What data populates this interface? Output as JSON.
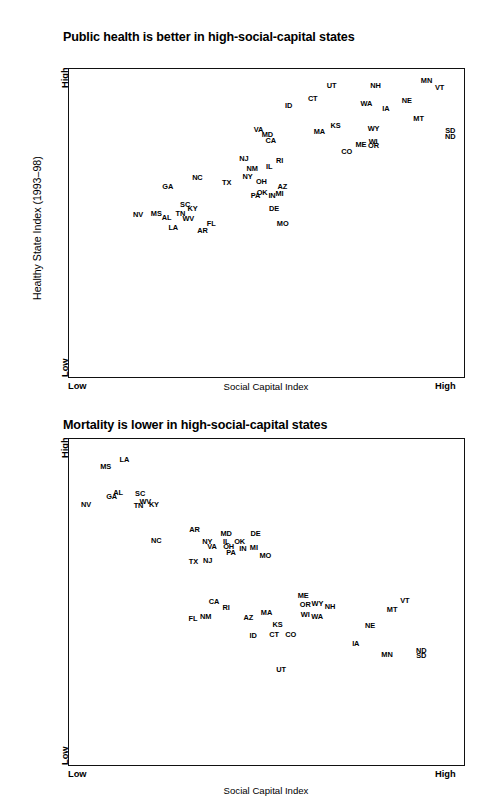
{
  "figure": {
    "axis_y_title": "Healthy State Index (1993–98)",
    "axis_x_title": "Social Capital Index",
    "low_label": "Low",
    "high_label": "High"
  },
  "chart_data": [
    {
      "type": "scatter",
      "title": "Public health is better in high-social-capital states",
      "xlabel": "Social Capital Index",
      "ylabel": "Healthy State Index (1993–98)",
      "xlim": [
        "Low",
        "High"
      ],
      "ylim": [
        "Low",
        "High"
      ],
      "grid": false,
      "legend": "none",
      "point_label_mode": "state-abbreviation",
      "points": [
        {
          "label": "UT",
          "x": 0.665,
          "y": 0.947
        },
        {
          "label": "NH",
          "x": 0.776,
          "y": 0.949
        },
        {
          "label": "MN",
          "x": 0.905,
          "y": 0.963
        },
        {
          "label": "VT",
          "x": 0.938,
          "y": 0.94
        },
        {
          "label": "CT",
          "x": 0.617,
          "y": 0.905
        },
        {
          "label": "NE",
          "x": 0.855,
          "y": 0.9
        },
        {
          "label": "WA",
          "x": 0.753,
          "y": 0.89
        },
        {
          "label": "ID",
          "x": 0.556,
          "y": 0.884
        },
        {
          "label": "IA",
          "x": 0.802,
          "y": 0.874
        },
        {
          "label": "MT",
          "x": 0.885,
          "y": 0.84
        },
        {
          "label": "KS",
          "x": 0.675,
          "y": 0.819
        },
        {
          "label": "WY",
          "x": 0.771,
          "y": 0.808
        },
        {
          "label": "VA",
          "x": 0.48,
          "y": 0.806
        },
        {
          "label": "MA",
          "x": 0.634,
          "y": 0.798
        },
        {
          "label": "SD",
          "x": 0.965,
          "y": 0.801
        },
        {
          "label": "MD",
          "x": 0.502,
          "y": 0.789
        },
        {
          "label": "ND",
          "x": 0.965,
          "y": 0.784
        },
        {
          "label": "CA",
          "x": 0.511,
          "y": 0.77
        },
        {
          "label": "WI",
          "x": 0.77,
          "y": 0.765
        },
        {
          "label": "ME",
          "x": 0.739,
          "y": 0.756
        },
        {
          "label": "OR",
          "x": 0.771,
          "y": 0.753
        },
        {
          "label": "CO",
          "x": 0.703,
          "y": 0.734
        },
        {
          "label": "NJ",
          "x": 0.443,
          "y": 0.71
        },
        {
          "label": "RI",
          "x": 0.533,
          "y": 0.704
        },
        {
          "label": "IL",
          "x": 0.507,
          "y": 0.685
        },
        {
          "label": "NM",
          "x": 0.464,
          "y": 0.68
        },
        {
          "label": "NY",
          "x": 0.452,
          "y": 0.651
        },
        {
          "label": "NC",
          "x": 0.325,
          "y": 0.65
        },
        {
          "label": "OH",
          "x": 0.487,
          "y": 0.635
        },
        {
          "label": "TX",
          "x": 0.399,
          "y": 0.633
        },
        {
          "label": "GA",
          "x": 0.25,
          "y": 0.62
        },
        {
          "label": "AZ",
          "x": 0.54,
          "y": 0.619
        },
        {
          "label": "OK",
          "x": 0.489,
          "y": 0.6
        },
        {
          "label": "MI",
          "x": 0.533,
          "y": 0.599
        },
        {
          "label": "PA",
          "x": 0.472,
          "y": 0.591
        },
        {
          "label": "IN",
          "x": 0.514,
          "y": 0.59
        },
        {
          "label": "SC",
          "x": 0.294,
          "y": 0.562
        },
        {
          "label": "KY",
          "x": 0.313,
          "y": 0.549
        },
        {
          "label": "DE",
          "x": 0.519,
          "y": 0.549
        },
        {
          "label": "NV",
          "x": 0.175,
          "y": 0.53
        },
        {
          "label": "MS",
          "x": 0.221,
          "y": 0.532
        },
        {
          "label": "TN",
          "x": 0.282,
          "y": 0.534
        },
        {
          "label": "AL",
          "x": 0.247,
          "y": 0.518
        },
        {
          "label": "WV",
          "x": 0.302,
          "y": 0.517
        },
        {
          "label": "FL",
          "x": 0.36,
          "y": 0.5
        },
        {
          "label": "MO",
          "x": 0.541,
          "y": 0.5
        },
        {
          "label": "LA",
          "x": 0.264,
          "y": 0.487
        },
        {
          "label": "AR",
          "x": 0.338,
          "y": 0.477
        }
      ]
    },
    {
      "type": "scatter",
      "title": "Mortality is lower in high-social-capital states",
      "xlabel": "Social Capital Index",
      "ylabel": "Healthy State Index (1993–98)",
      "xlim": [
        "Low",
        "High"
      ],
      "ylim": [
        "Low",
        "High"
      ],
      "grid": false,
      "legend": "none",
      "point_label_mode": "state-abbreviation",
      "points": [
        {
          "label": "LA",
          "x": 0.14,
          "y": 0.94
        },
        {
          "label": "MS",
          "x": 0.093,
          "y": 0.916
        },
        {
          "label": "AL",
          "x": 0.124,
          "y": 0.838
        },
        {
          "label": "SC",
          "x": 0.18,
          "y": 0.834
        },
        {
          "label": "GA",
          "x": 0.108,
          "y": 0.825
        },
        {
          "label": "WV",
          "x": 0.193,
          "y": 0.81
        },
        {
          "label": "NV",
          "x": 0.043,
          "y": 0.802
        },
        {
          "label": "KY",
          "x": 0.215,
          "y": 0.8
        },
        {
          "label": "TN",
          "x": 0.176,
          "y": 0.797
        },
        {
          "label": "AR",
          "x": 0.318,
          "y": 0.724
        },
        {
          "label": "MD",
          "x": 0.398,
          "y": 0.711
        },
        {
          "label": "DE",
          "x": 0.472,
          "y": 0.711
        },
        {
          "label": "NC",
          "x": 0.221,
          "y": 0.69
        },
        {
          "label": "NY",
          "x": 0.35,
          "y": 0.688
        },
        {
          "label": "IL",
          "x": 0.398,
          "y": 0.688
        },
        {
          "label": "OK",
          "x": 0.432,
          "y": 0.688
        },
        {
          "label": "VA",
          "x": 0.362,
          "y": 0.673
        },
        {
          "label": "OH",
          "x": 0.404,
          "y": 0.672
        },
        {
          "label": "IN",
          "x": 0.44,
          "y": 0.666
        },
        {
          "label": "MI",
          "x": 0.468,
          "y": 0.669
        },
        {
          "label": "PA",
          "x": 0.41,
          "y": 0.654
        },
        {
          "label": "MO",
          "x": 0.497,
          "y": 0.644
        },
        {
          "label": "TX",
          "x": 0.315,
          "y": 0.626
        },
        {
          "label": "NJ",
          "x": 0.351,
          "y": 0.628
        },
        {
          "label": "ME",
          "x": 0.593,
          "y": 0.523
        },
        {
          "label": "VT",
          "x": 0.85,
          "y": 0.506
        },
        {
          "label": "CA",
          "x": 0.367,
          "y": 0.503
        },
        {
          "label": "OR",
          "x": 0.598,
          "y": 0.493
        },
        {
          "label": "WY",
          "x": 0.629,
          "y": 0.496
        },
        {
          "label": "NH",
          "x": 0.661,
          "y": 0.488
        },
        {
          "label": "RI",
          "x": 0.398,
          "y": 0.485
        },
        {
          "label": "MT",
          "x": 0.818,
          "y": 0.478
        },
        {
          "label": "MA",
          "x": 0.5,
          "y": 0.47
        },
        {
          "label": "WI",
          "x": 0.598,
          "y": 0.464
        },
        {
          "label": "NM",
          "x": 0.346,
          "y": 0.458
        },
        {
          "label": "WA",
          "x": 0.628,
          "y": 0.456
        },
        {
          "label": "AZ",
          "x": 0.454,
          "y": 0.455
        },
        {
          "label": "FL",
          "x": 0.314,
          "y": 0.451
        },
        {
          "label": "KS",
          "x": 0.528,
          "y": 0.432
        },
        {
          "label": "NE",
          "x": 0.762,
          "y": 0.428
        },
        {
          "label": "CO",
          "x": 0.561,
          "y": 0.403
        },
        {
          "label": "CT",
          "x": 0.519,
          "y": 0.401
        },
        {
          "label": "ID",
          "x": 0.466,
          "y": 0.398
        },
        {
          "label": "IA",
          "x": 0.726,
          "y": 0.374
        },
        {
          "label": "ND",
          "x": 0.892,
          "y": 0.352
        },
        {
          "label": "MN",
          "x": 0.805,
          "y": 0.341
        },
        {
          "label": "SD",
          "x": 0.892,
          "y": 0.338
        },
        {
          "label": "UT",
          "x": 0.537,
          "y": 0.296
        }
      ]
    }
  ]
}
